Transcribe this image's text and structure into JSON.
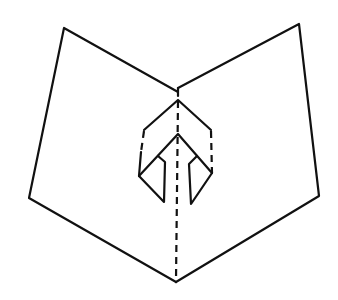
{
  "figure": {
    "stroke_color": "#111111",
    "background_color": "#ffffff",
    "cropped_text_top": ""
  },
  "card": {
    "left_wing": {
      "label": "left card panel",
      "points": [
        [
          178,
          92
        ],
        [
          64,
          28
        ],
        [
          29,
          198
        ],
        [
          176,
          282
        ]
      ]
    },
    "right_wing": {
      "label": "right card panel",
      "points": [
        [
          178,
          88
        ],
        [
          299,
          24
        ],
        [
          319,
          196
        ],
        [
          176,
          282
        ]
      ]
    },
    "center_fold": {
      "label": "center fold (dashed)",
      "from": [
        178,
        98
      ],
      "to": [
        176,
        282
      ]
    }
  },
  "popup": {
    "label": "arrow-shaped pop-up",
    "outer_hood": [
      [
        144,
        130
      ],
      [
        178,
        100
      ],
      [
        211,
        130
      ]
    ],
    "left_side_dashed": [
      [
        144,
        130
      ],
      [
        141,
        152
      ]
    ],
    "left_side_solid": [
      [
        141,
        152
      ],
      [
        139,
        176
      ]
    ],
    "right_side_dashed": [
      [
        211,
        130
      ],
      [
        212,
        173
      ]
    ],
    "inner_chevron": [
      [
        139,
        176
      ],
      [
        178,
        134
      ],
      [
        212,
        173
      ]
    ],
    "left_flap": [
      [
        158,
        156
      ],
      [
        165,
        162
      ],
      [
        164,
        202
      ],
      [
        139,
        176
      ]
    ],
    "right_flap": [
      [
        197,
        156
      ],
      [
        189,
        164
      ],
      [
        191,
        204
      ],
      [
        212,
        173
      ]
    ]
  }
}
